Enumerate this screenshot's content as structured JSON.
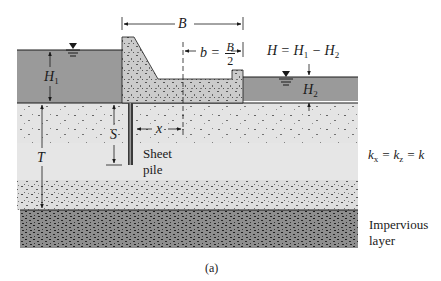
{
  "figure": {
    "caption": "(a)",
    "colors": {
      "water": "#9a9a9a",
      "soil": "#e4e4e4",
      "dam": "#c8c8c8",
      "impervious": "#8e8e8e",
      "line": "#1a1a1a",
      "sheet_pile": "#3a3a3a"
    },
    "labels": {
      "B": "B",
      "b_eq_left": "b = ",
      "b_frac_num": "B",
      "b_frac_den": "2",
      "H_equation_lhs": "H = H",
      "H_equation_sub1": "1",
      "H_equation_mid": " − H",
      "H_equation_sub2": "2",
      "H1_main": "H",
      "H1_sub": "1",
      "H2_main": "H",
      "H2_sub": "2",
      "S": "S",
      "T": "T",
      "x": "x",
      "sheet_pile_line1": "Sheet",
      "sheet_pile_line2": "pile",
      "permeability_k1": "k",
      "permeability_k1_sub": "x",
      "permeability_eq1": " = k",
      "permeability_k2_sub": "z",
      "permeability_eq2": " = k",
      "impervious_line1": "Impervious",
      "impervious_line2": "layer"
    },
    "icons": {
      "water_table_left": "water-table-symbol",
      "water_table_right": "water-table-symbol"
    }
  }
}
